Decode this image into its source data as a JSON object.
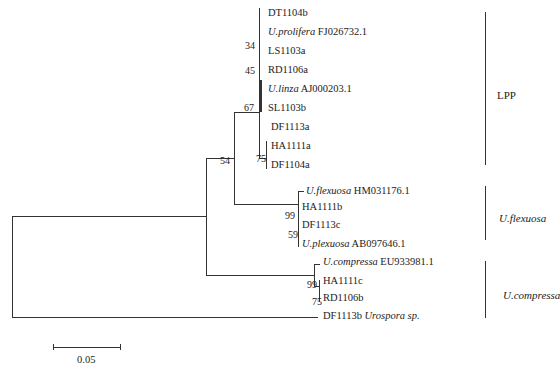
{
  "tree": {
    "leaves": [
      {
        "id": "DT1104b",
        "italic": "",
        "text": "DT1104b",
        "y": 13
      },
      {
        "id": "U_prolifera",
        "italic": "U.prolifera",
        "text": " FJ026732.1",
        "y": 32
      },
      {
        "id": "LS1103a",
        "italic": "",
        "text": "LS1103a",
        "y": 51
      },
      {
        "id": "RD1106a",
        "italic": "",
        "text": "RD1106a",
        "y": 70
      },
      {
        "id": "U_linza",
        "italic": "U.linza",
        "text": " AJ000203.1",
        "y": 89
      },
      {
        "id": "SL1103b",
        "italic": "",
        "text": "SL1103b",
        "y": 108
      },
      {
        "id": "DF1113a",
        "italic": "",
        "text": "DF1113a",
        "y": 127
      },
      {
        "id": "HA1111a",
        "italic": "",
        "text": "HA1111a",
        "y": 146
      },
      {
        "id": "DF1104a",
        "italic": "",
        "text": "DF1104a",
        "y": 165
      },
      {
        "id": "U_flexuosa",
        "italic": "U.flexuosa",
        "text": " HM031176.1",
        "y": 189
      },
      {
        "id": "HA1111b",
        "italic": "",
        "text": "HA1111b",
        "y": 207
      },
      {
        "id": "DF1113c",
        "italic": "",
        "text": "DF1113c",
        "y": 225
      },
      {
        "id": "U_plexuosa",
        "italic": "U.plexuosa",
        "text": " AB097646.1",
        "y": 244
      },
      {
        "id": "U_compressa",
        "italic": "U.compressa",
        "text": " EU933981.1",
        "y": 262
      },
      {
        "id": "HA1111c",
        "italic": "",
        "text": "HA1111c",
        "y": 281
      },
      {
        "id": "RD1106b",
        "italic": "",
        "text": "RD1106b",
        "y": 298
      },
      {
        "id": "DF1113b",
        "italic": "",
        "text": "DF1113b ",
        "italic_after": "Urospora sp.",
        "y": 316
      }
    ],
    "bootstrap": [
      {
        "value": "34",
        "x": 244,
        "y": 44
      },
      {
        "value": "45",
        "x": 244,
        "y": 64
      },
      {
        "value": "67",
        "x": 243,
        "y": 99
      },
      {
        "value": "75",
        "x": 256,
        "y": 152
      },
      {
        "value": "54",
        "x": 221,
        "y": 145
      },
      {
        "value": "99",
        "x": 283,
        "y": 208
      },
      {
        "value": "59",
        "x": 288,
        "y": 228
      },
      {
        "value": "99",
        "x": 306,
        "y": 278
      },
      {
        "value": "75",
        "x": 311,
        "y": 296
      }
    ]
  },
  "clades": [
    {
      "label": "LPP",
      "italic": false
    },
    {
      "label": "U.flexuosa",
      "italic": true
    },
    {
      "label": "U.compressa",
      "italic": true
    }
  ],
  "scale_bar": {
    "label": "0.05"
  }
}
